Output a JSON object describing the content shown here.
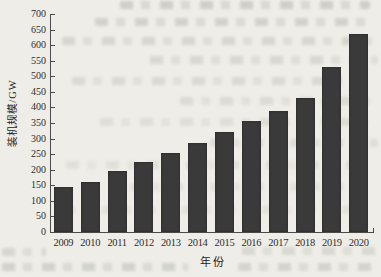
{
  "chart_data": {
    "type": "bar",
    "title": "",
    "categories": [
      "2009",
      "2010",
      "2011",
      "2012",
      "2013",
      "2014",
      "2015",
      "2016",
      "2017",
      "2018",
      "2019",
      "2020"
    ],
    "values": [
      145,
      160,
      195,
      225,
      255,
      285,
      320,
      355,
      390,
      430,
      530,
      635
    ],
    "xlabel": "年份",
    "ylabel": "装机规模/GW",
    "ylim": [
      0,
      700
    ],
    "ytick_step": 50,
    "yticks": [
      0,
      50,
      100,
      150,
      200,
      250,
      300,
      350,
      400,
      450,
      500,
      550,
      600,
      650,
      700
    ],
    "grid": false,
    "legend": null,
    "bar_color": "#3a3a3a",
    "axis_color": "#4a4a4a",
    "text_color": "#2e2e2e",
    "background_color": "#eeede7"
  }
}
